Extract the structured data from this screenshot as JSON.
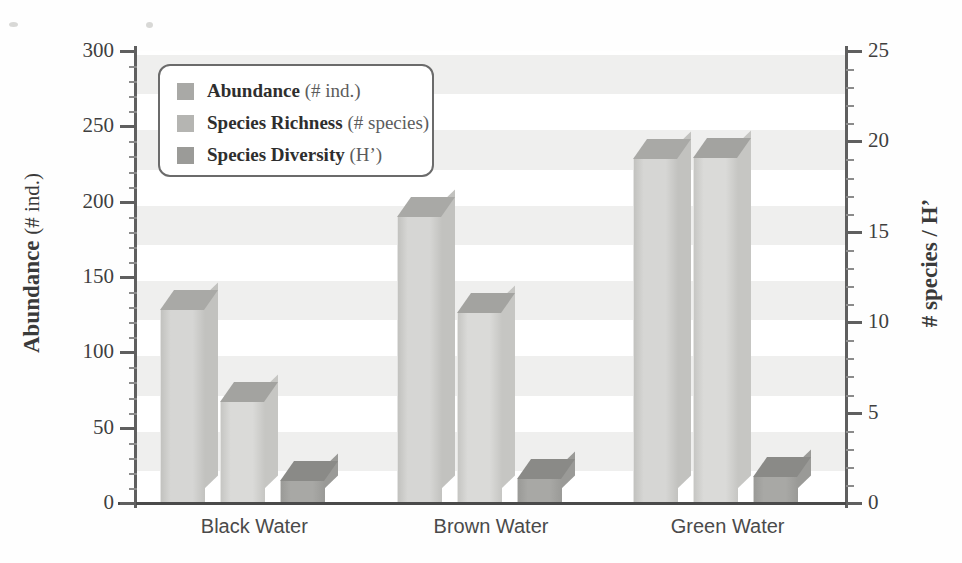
{
  "chart_data": {
    "type": "bar",
    "title": "",
    "categories": [
      "Black Water",
      "Brown Water",
      "Green Water"
    ],
    "series": [
      {
        "name": "Abundance",
        "unit": "# ind.",
        "axis": "left",
        "color": "#d6d6d4",
        "top_color": "#a9a9a6",
        "side_color": "#c2c2bf",
        "values": [
          128,
          190,
          228
        ]
      },
      {
        "name": "Species Richness",
        "unit": "# species",
        "axis": "right",
        "color": "#dadad8",
        "top_color": "#a3a3a0",
        "side_color": "#c6c6c3",
        "values": [
          5.6,
          10.5,
          19.1
        ]
      },
      {
        "name": "Species Diversity",
        "unit": "H'",
        "axis": "right",
        "color": "#a8a8a5",
        "top_color": "#8a8a87",
        "side_color": "#9a9a97",
        "values": [
          1.2,
          1.35,
          1.45
        ]
      }
    ],
    "ylabel": "Abundance (# ind.)",
    "ylabel_left_main": "Abundance",
    "ylabel_left_paren": "(# ind.)",
    "ylabel_right": "# species / H'",
    "xlabel": "",
    "ylim": [
      0,
      300
    ],
    "y2lim": [
      0,
      25
    ],
    "yticks": [
      "0",
      "50",
      "100",
      "150",
      "200",
      "250",
      "300"
    ],
    "ytick_values": [
      0,
      50,
      100,
      150,
      200,
      250,
      300
    ],
    "y2ticks": [
      "0",
      "5",
      "10",
      "15",
      "20",
      "25"
    ],
    "y2tick_values": [
      0,
      5,
      10,
      15,
      20,
      25
    ],
    "grid": "horizontal-bands",
    "legend_position": "upper-left-inside"
  },
  "legend": {
    "items": [
      {
        "label": "Abundance",
        "paren": "(# ind.)",
        "color": "#a9a9a6"
      },
      {
        "label": "Species Richness",
        "paren": "(# species)",
        "color": "#b5b5b2"
      },
      {
        "label": "Species Diversity",
        "paren": "(H’)",
        "color": "#9b9b98"
      }
    ]
  },
  "axes": {
    "left_title_main": "Abundance",
    "left_title_paren": "(# ind.)",
    "right_title": "# species / H’"
  }
}
